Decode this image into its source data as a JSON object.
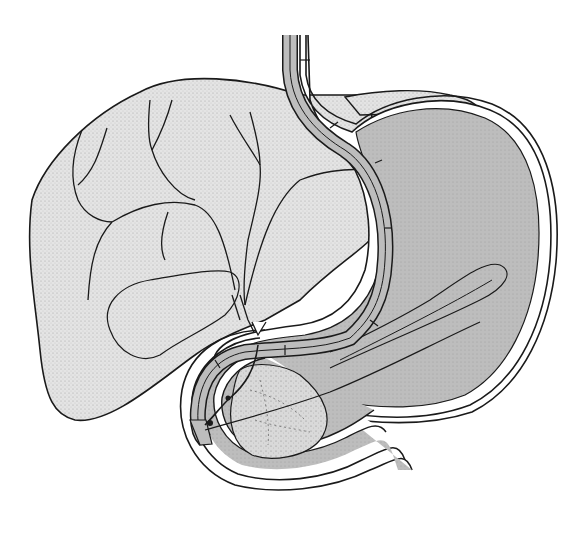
{
  "figure": {
    "structures": [
      {
        "id": "liver",
        "name": "Liver"
      },
      {
        "id": "biliary-tree",
        "name": "Intrahepatic bile ducts"
      },
      {
        "id": "gallbladder",
        "name": "Gallbladder"
      },
      {
        "id": "esophagus",
        "name": "Esophagus"
      },
      {
        "id": "stomach",
        "name": "Stomach"
      },
      {
        "id": "duodenum",
        "name": "Duodenum"
      },
      {
        "id": "pancreas-head",
        "name": "Pancreatic head"
      },
      {
        "id": "endoscope",
        "name": "Endoscope"
      },
      {
        "id": "catheter",
        "name": "Cannulation catheter"
      }
    ],
    "colors": {
      "background": "#ffffff",
      "liver_fill": "#e2e2e2",
      "organ_fill": "#bdbdbd",
      "wall_fill": "#ffffff",
      "outline": "#1a1a1a",
      "pancreas_fill": "#d6d6d6"
    }
  }
}
